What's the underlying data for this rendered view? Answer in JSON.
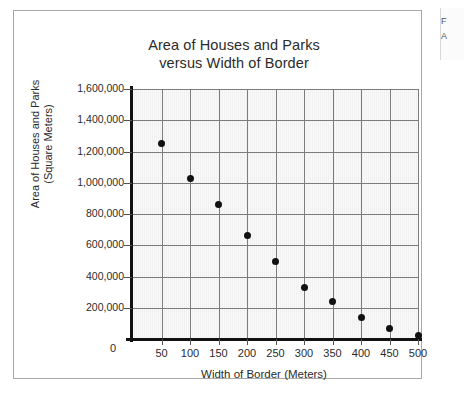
{
  "figure": {
    "title_line1": "Area of Houses and Parks",
    "title_line2": "versus Width of Border",
    "y_axis_title_line1": "Area of Houses and Parks",
    "y_axis_title_line2": "(Square Meters)",
    "x_axis_title": "Width of Border (Meters)",
    "origin_label": "0"
  },
  "margin_note": {
    "line1": "F",
    "line2": "A"
  },
  "colors": {
    "plot_background": "#f1f1f1",
    "gridline": "#7c7c7c",
    "axis": "#111111",
    "marker": "#111111",
    "text": "#2b2b2b",
    "card_border": "#a8a8a8"
  },
  "chart_data": {
    "type": "scatter",
    "title": "Area of Houses and Parks versus Width of Border",
    "xlabel": "Width of Border (Meters)",
    "ylabel": "Area of Houses and Parks (Square Meters)",
    "xlim": [
      0,
      500
    ],
    "ylim": [
      0,
      1600000
    ],
    "grid": true,
    "legend": "none",
    "x_ticks": [
      0,
      50,
      100,
      150,
      200,
      250,
      300,
      350,
      400,
      450,
      500
    ],
    "x_tick_labels": [
      "0",
      "50",
      "100",
      "150",
      "200",
      "250",
      "300",
      "350",
      "400",
      "450",
      "500"
    ],
    "y_ticks": [
      0,
      200000,
      400000,
      600000,
      800000,
      1000000,
      1200000,
      1400000,
      1600000
    ],
    "y_tick_labels": [
      "0",
      "200,000",
      "400,000",
      "600,000",
      "800,000",
      "1,000,000",
      "1,200,000",
      "1,400,000",
      "1,600,000"
    ],
    "x": [
      50,
      100,
      150,
      200,
      250,
      300,
      350,
      400,
      450,
      500
    ],
    "y": [
      1250000,
      1030000,
      860000,
      660000,
      495000,
      330000,
      240000,
      140000,
      65000,
      20000
    ],
    "points": [
      {
        "x": 50,
        "y": 1250000
      },
      {
        "x": 100,
        "y": 1030000
      },
      {
        "x": 150,
        "y": 860000
      },
      {
        "x": 200,
        "y": 660000
      },
      {
        "x": 250,
        "y": 495000
      },
      {
        "x": 300,
        "y": 330000
      },
      {
        "x": 350,
        "y": 240000
      },
      {
        "x": 400,
        "y": 140000
      },
      {
        "x": 450,
        "y": 65000
      },
      {
        "x": 500,
        "y": 20000
      }
    ]
  }
}
